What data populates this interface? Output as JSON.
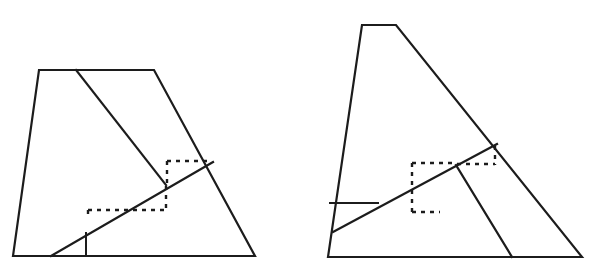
{
  "page": {
    "background_color": "#ffffff",
    "line_color": "#1c1c1c",
    "width": 593,
    "height": 274
  },
  "figures": [
    {
      "id": "left-figure",
      "name": "trapezoid-with-transversal-left",
      "description": "Trapezoid with a steep diagonal from top edge to an interior point and a long shallow diagonal crossing it, with two dotted right-angle squares at the crossing.",
      "outline": {
        "name": "trapezoid-outline",
        "points": "39,70 154,70 255,256 13,256",
        "closed": true
      },
      "solid_segments": [
        {
          "name": "steep-diagonal",
          "points": "76,70 166,185"
        },
        {
          "name": "shallow-diagonal",
          "points": "51,256 213,162"
        },
        {
          "name": "short-vertical",
          "points": "86,233 86,256"
        }
      ],
      "dotted_segments": [
        {
          "name": "upper-square-top",
          "points": "167,161 210,161"
        },
        {
          "name": "upper-square-left",
          "points": "167,161 167,186"
        },
        {
          "name": "lower-square-horizontal",
          "points": "88,210 166,210"
        },
        {
          "name": "lower-square-right",
          "points": "166,186 166,211"
        },
        {
          "name": "lower-square-left-tick",
          "points": "88,210 88,219"
        }
      ]
    },
    {
      "id": "right-figure",
      "name": "trapezoid-with-transversal-right",
      "description": "Tall trapezoid with a long shallow diagonal from the lower-left vertex, a short horizontal chord, a descending cevian to the base, and a dotted right-angle pair at the crossing.",
      "outline": {
        "name": "trapezoid-outline",
        "points": "362,25 396,25 582,257 328,257",
        "closed": true
      },
      "solid_segments": [
        {
          "name": "shallow-diagonal",
          "points": "333,232 497,144"
        },
        {
          "name": "short-horizontal-chord",
          "points": "330,203 378,203"
        },
        {
          "name": "descending-cevian",
          "points": "456,165 512,257"
        }
      ],
      "dotted_segments": [
        {
          "name": "left-square-top",
          "points": "412,163 455,163"
        },
        {
          "name": "left-square-left",
          "points": "412,163 412,212"
        },
        {
          "name": "left-square-bottom",
          "points": "412,212 440,212"
        },
        {
          "name": "right-square-horizontal",
          "points": "457,164 495,164"
        },
        {
          "name": "right-square-right",
          "points": "495,146 495,165"
        }
      ]
    }
  ]
}
